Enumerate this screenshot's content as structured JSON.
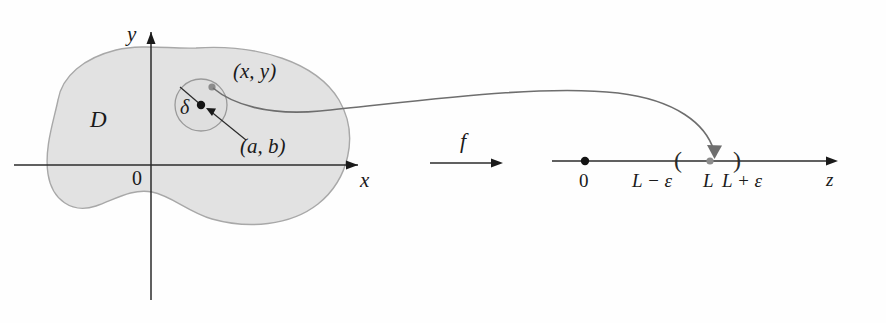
{
  "figure": {
    "colors": {
      "region_fill": "#e2e2e2",
      "region_stroke": "#a8a8a8",
      "disk_stroke": "#9a9a9a",
      "axis": "#2b2b2b",
      "curve": "#6e6e6e",
      "point_dark": "#141414",
      "point_gray": "#8c8c8c"
    }
  },
  "domain_plane": {
    "axis_labels": {
      "y_axis": "y",
      "x_axis": "x",
      "origin": "0"
    },
    "region_label": "D",
    "disk": {
      "radius_label": "δ",
      "center_label": "(a, b)",
      "sample_point_label": "(x, y)",
      "center": {
        "x": 201,
        "y": 105
      },
      "radius": 26
    }
  },
  "mapping": {
    "function_label": "f"
  },
  "number_line": {
    "axis_label": "z",
    "origin_label": "0",
    "lower_bound_label": "L − ε",
    "limit_label": "L",
    "upper_bound_label": "L + ε",
    "open_interval_open": "(",
    "open_interval_close": ")",
    "positions": {
      "origin_x": 585,
      "lower_bound_x": 679,
      "limit_x": 710,
      "upper_bound_x": 737,
      "axis_y": 161
    }
  }
}
